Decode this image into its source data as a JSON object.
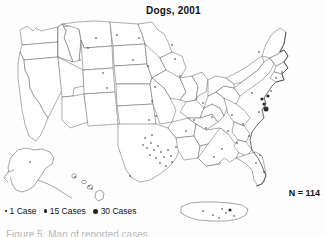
{
  "figure": {
    "title": "Dogs, 2001",
    "total_annotation": "N = 114",
    "caption_partial": "Figure 5. Map of reported cases",
    "background_color": "#fdfdfd",
    "outline_color": "#4a4a4a",
    "dot_color": "#2b2b2b"
  },
  "legend": {
    "items": [
      {
        "label": "1 Case",
        "size": "small",
        "value": 1
      },
      {
        "label": "15 Cases",
        "size": "medium",
        "value": 15
      },
      {
        "label": "30 Cases",
        "size": "large",
        "value": 30
      }
    ]
  },
  "chart_data": {
    "type": "scatter",
    "title": "Dogs, 2001",
    "subtitle": "",
    "xlabel": "",
    "ylabel": "",
    "annotation": "N = 114",
    "total_cases": 114,
    "grid": false,
    "legend_position": "bottom-left",
    "symbol_scale": [
      {
        "cases": 1,
        "radius_px": 0.8
      },
      {
        "cases": 15,
        "radius_px": 1.6
      },
      {
        "cases": 30,
        "radius_px": 2.5
      }
    ],
    "regions": [
      {
        "name": "contiguous-united-states",
        "kind": "main-map"
      },
      {
        "name": "alaska",
        "kind": "inset"
      },
      {
        "name": "hawaii",
        "kind": "inset"
      },
      {
        "name": "puerto-rico",
        "kind": "inset"
      }
    ],
    "points": [
      {
        "x": 96,
        "y": 38,
        "cases": 1,
        "region": "north-dakota"
      },
      {
        "x": 117,
        "y": 35,
        "cases": 1,
        "region": "north-dakota"
      },
      {
        "x": 139,
        "y": 38,
        "cases": 1,
        "region": "minnesota"
      },
      {
        "x": 172,
        "y": 45,
        "cases": 1,
        "region": "minnesota"
      },
      {
        "x": 175,
        "y": 59,
        "cases": 1,
        "region": "wisconsin"
      },
      {
        "x": 180,
        "y": 76,
        "cases": 1,
        "region": "wisconsin"
      },
      {
        "x": 133,
        "y": 60,
        "cases": 1,
        "region": "south-dakota"
      },
      {
        "x": 148,
        "y": 66,
        "cases": 1,
        "region": "nebraska"
      },
      {
        "x": 88,
        "y": 48,
        "cases": 1,
        "region": "montana"
      },
      {
        "x": 103,
        "y": 73,
        "cases": 1,
        "region": "wyoming"
      },
      {
        "x": 107,
        "y": 88,
        "cases": 1,
        "region": "colorado"
      },
      {
        "x": 155,
        "y": 87,
        "cases": 1,
        "region": "kansas"
      },
      {
        "x": 152,
        "y": 101,
        "cases": 1,
        "region": "kansas"
      },
      {
        "x": 156,
        "y": 116,
        "cases": 1,
        "region": "oklahoma"
      },
      {
        "x": 149,
        "y": 120,
        "cases": 1,
        "region": "oklahoma"
      },
      {
        "x": 143,
        "y": 145,
        "cases": 1,
        "region": "texas"
      },
      {
        "x": 147,
        "y": 148,
        "cases": 1,
        "region": "texas"
      },
      {
        "x": 151,
        "y": 143,
        "cases": 1,
        "region": "texas"
      },
      {
        "x": 154,
        "y": 150,
        "cases": 1,
        "region": "texas"
      },
      {
        "x": 158,
        "y": 146,
        "cases": 1,
        "region": "texas"
      },
      {
        "x": 150,
        "y": 155,
        "cases": 1,
        "region": "texas"
      },
      {
        "x": 156,
        "y": 158,
        "cases": 1,
        "region": "texas"
      },
      {
        "x": 161,
        "y": 152,
        "cases": 1,
        "region": "texas"
      },
      {
        "x": 164,
        "y": 157,
        "cases": 1,
        "region": "texas"
      },
      {
        "x": 168,
        "y": 150,
        "cases": 1,
        "region": "texas"
      },
      {
        "x": 171,
        "y": 156,
        "cases": 1,
        "region": "texas"
      },
      {
        "x": 160,
        "y": 163,
        "cases": 1,
        "region": "texas"
      },
      {
        "x": 166,
        "y": 166,
        "cases": 1,
        "region": "texas"
      },
      {
        "x": 172,
        "y": 162,
        "cases": 1,
        "region": "texas"
      },
      {
        "x": 176,
        "y": 147,
        "cases": 1,
        "region": "texas"
      },
      {
        "x": 145,
        "y": 138,
        "cases": 1,
        "region": "texas"
      },
      {
        "x": 152,
        "y": 135,
        "cases": 1,
        "region": "texas"
      },
      {
        "x": 130,
        "y": 176,
        "cases": 1,
        "region": "texas-south"
      },
      {
        "x": 186,
        "y": 131,
        "cases": 1,
        "region": "arkansas"
      },
      {
        "x": 194,
        "y": 120,
        "cases": 1,
        "region": "missouri"
      },
      {
        "x": 203,
        "y": 103,
        "cases": 1,
        "region": "illinois"
      },
      {
        "x": 212,
        "y": 117,
        "cases": 1,
        "region": "kentucky"
      },
      {
        "x": 206,
        "y": 128,
        "cases": 1,
        "region": "tennessee"
      },
      {
        "x": 228,
        "y": 131,
        "cases": 1,
        "region": "tennessee"
      },
      {
        "x": 232,
        "y": 115,
        "cases": 1,
        "region": "virginia"
      },
      {
        "x": 243,
        "y": 124,
        "cases": 1,
        "region": "north-carolina"
      },
      {
        "x": 237,
        "y": 143,
        "cases": 1,
        "region": "south-carolina"
      },
      {
        "x": 249,
        "y": 136,
        "cases": 1,
        "region": "south-carolina"
      },
      {
        "x": 222,
        "y": 149,
        "cases": 1,
        "region": "georgia"
      },
      {
        "x": 214,
        "y": 157,
        "cases": 1,
        "region": "georgia"
      },
      {
        "x": 260,
        "y": 155,
        "cases": 1,
        "region": "florida-north"
      },
      {
        "x": 256,
        "y": 163,
        "cases": 1,
        "region": "florida"
      },
      {
        "x": 264,
        "y": 172,
        "cases": 1,
        "region": "florida"
      },
      {
        "x": 252,
        "y": 93,
        "cases": 1,
        "region": "pennsylvania"
      },
      {
        "x": 262,
        "y": 99,
        "cases": 15,
        "region": "new-jersey"
      },
      {
        "x": 264,
        "y": 104,
        "cases": 15,
        "region": "maryland"
      },
      {
        "x": 266,
        "y": 109,
        "cases": 30,
        "region": "maryland-delaware"
      },
      {
        "x": 268,
        "y": 96,
        "cases": 15,
        "region": "new-jersey-north"
      },
      {
        "x": 271,
        "y": 91,
        "cases": 1,
        "region": "new-york-metro"
      },
      {
        "x": 259,
        "y": 112,
        "cases": 1,
        "region": "virginia-north"
      },
      {
        "x": 276,
        "y": 78,
        "cases": 1,
        "region": "connecticut"
      },
      {
        "x": 282,
        "y": 72,
        "cases": 1,
        "region": "massachusetts"
      },
      {
        "x": 259,
        "y": 52,
        "cases": 1,
        "region": "new-york"
      },
      {
        "x": 30,
        "y": 162,
        "cases": 1,
        "region": "alaska"
      },
      {
        "x": 75,
        "y": 177,
        "cases": 1,
        "region": "hawaii-kauai"
      },
      {
        "x": 89,
        "y": 186,
        "cases": 1,
        "region": "hawaii-maui"
      },
      {
        "x": 92,
        "y": 189,
        "cases": 1,
        "region": "hawaii-maui2"
      },
      {
        "x": 203,
        "y": 211,
        "cases": 1,
        "region": "puerto-rico-west"
      },
      {
        "x": 213,
        "y": 215,
        "cases": 1,
        "region": "puerto-rico"
      },
      {
        "x": 222,
        "y": 209,
        "cases": 1,
        "region": "puerto-rico"
      },
      {
        "x": 226,
        "y": 213,
        "cases": 1,
        "region": "puerto-rico"
      },
      {
        "x": 230,
        "y": 210,
        "cases": 15,
        "region": "puerto-rico-san-juan"
      },
      {
        "x": 234,
        "y": 216,
        "cases": 1,
        "region": "puerto-rico-east"
      },
      {
        "x": 219,
        "y": 218,
        "cases": 1,
        "region": "puerto-rico-south"
      }
    ]
  }
}
